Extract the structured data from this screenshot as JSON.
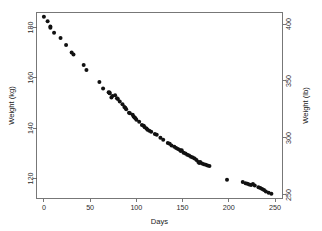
{
  "chart_data": {
    "type": "scatter",
    "title": "",
    "xlabel": "Days",
    "ylabel": "Weight (kg)",
    "y2label": "Weight (lb)",
    "xlim": [
      -8,
      258
    ],
    "ylim": [
      112,
      186
    ],
    "y2lim": [
      246.9,
      410.1
    ],
    "grid": false,
    "legend": null,
    "xticks": [
      0,
      50,
      100,
      150,
      200,
      250
    ],
    "xticklabels": [
      "0",
      "50",
      "100",
      "150",
      "200",
      "250"
    ],
    "yticks": [
      120,
      140,
      160,
      180
    ],
    "yticklabels": [
      "120",
      "140",
      "160",
      "180"
    ],
    "y2ticks": [
      250,
      300,
      350,
      400
    ],
    "y2ticklabels": [
      "250",
      "300",
      "350",
      "400"
    ],
    "marker": "filled-circle",
    "marker_color": "#111111",
    "marker_size": 2.0,
    "x": [
      0,
      4,
      7,
      7,
      11,
      18,
      24,
      30,
      32,
      43,
      46,
      60,
      64,
      70,
      71,
      71,
      73,
      74,
      77,
      79,
      80,
      82,
      85,
      87,
      88,
      89,
      92,
      93,
      96,
      97,
      98,
      99,
      100,
      103,
      106,
      108,
      109,
      111,
      112,
      114,
      116,
      120,
      122,
      126,
      129,
      134,
      136,
      138,
      141,
      143,
      145,
      147,
      148,
      149,
      151,
      153,
      155,
      157,
      159,
      161,
      163,
      165,
      167,
      168,
      169,
      171,
      173,
      175,
      177,
      179,
      198,
      215,
      218,
      220,
      222,
      224,
      226,
      228,
      232,
      234,
      236,
      238,
      240,
      243,
      246
    ],
    "y": [
      184.35,
      182.51,
      180.45,
      179.91,
      177.91,
      175.81,
      173.11,
      170.06,
      169.31,
      165.1,
      163.11,
      158.3,
      155.8,
      154.31,
      153.86,
      154.2,
      152.2,
      152.8,
      153.1,
      151.91,
      151.61,
      150.6,
      149.5,
      148.4,
      148.1,
      147.5,
      146.1,
      145.9,
      145.3,
      144.6,
      144.2,
      143.9,
      143.3,
      142.5,
      141.2,
      140.9,
      140.3,
      139.8,
      139.4,
      139.0,
      138.6,
      137.7,
      137.4,
      136.2,
      135.4,
      134.1,
      133.8,
      133.1,
      132.6,
      132.1,
      131.7,
      131.3,
      130.9,
      131.2,
      130.2,
      129.9,
      129.4,
      129.1,
      128.6,
      128.3,
      127.9,
      127.3,
      126.5,
      126.1,
      126.5,
      125.9,
      125.6,
      125.4,
      125.1,
      124.9,
      119.5,
      118.6,
      118.1,
      117.9,
      117.6,
      117.4,
      117.8,
      117.2,
      116.5,
      116.2,
      115.8,
      115.4,
      114.8,
      114.3,
      113.9
    ]
  },
  "axes": {
    "x_title": "Days",
    "y_left_title": "Weight (kg)",
    "y_right_title": "Weight (lb)"
  }
}
